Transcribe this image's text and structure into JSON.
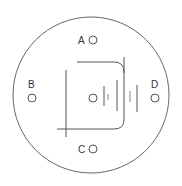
{
  "diagram": {
    "type": "circuit-board-schematic",
    "terminals": [
      {
        "id": "A",
        "label": "A"
      },
      {
        "id": "B",
        "label": "B"
      },
      {
        "id": "C",
        "label": "C"
      },
      {
        "id": "D",
        "label": "D"
      }
    ],
    "center_terminal": {
      "label": ""
    },
    "colors": {
      "line": "#555555",
      "outline": "#666666",
      "text": "#333333",
      "background": "#ffffff"
    }
  }
}
